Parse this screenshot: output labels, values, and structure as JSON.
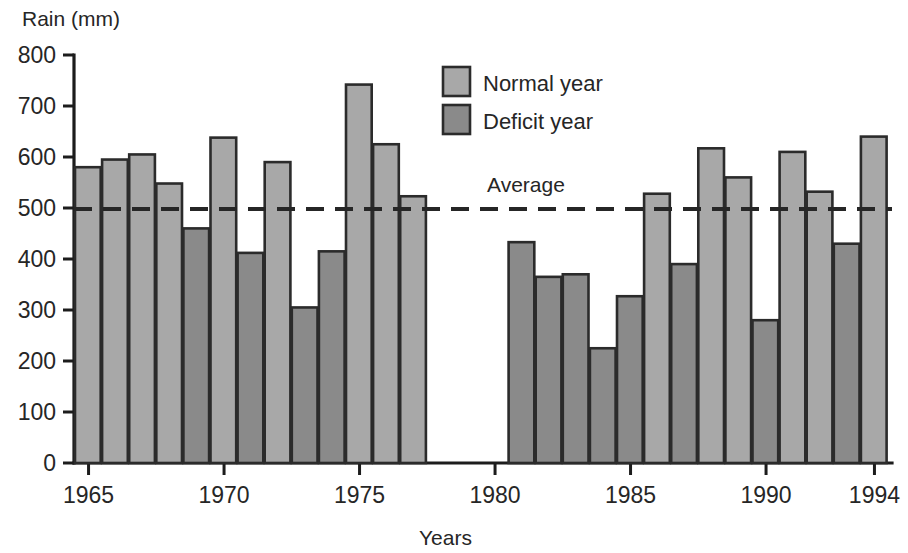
{
  "chart_data": {
    "type": "bar",
    "title": "",
    "xlabel": "Years",
    "ylabel": "Rain (mm)",
    "ylim": [
      0,
      800
    ],
    "xlim": [
      1964.5,
      1994.5
    ],
    "yticks": [
      0,
      100,
      200,
      300,
      400,
      500,
      600,
      700,
      800
    ],
    "ytick_labels": [
      "0",
      "100",
      "200",
      "300",
      "400",
      "500",
      "600",
      "700",
      "800"
    ],
    "xticks": [
      1965,
      1970,
      1975,
      1980,
      1985,
      1990,
      1994
    ],
    "xtick_labels": [
      "1965",
      "1970",
      "1975",
      "1980",
      "1985",
      "1990",
      "1994"
    ],
    "grid": false,
    "legend_position": "top-center",
    "legend": [
      {
        "label": "Normal year",
        "color": "#a8a8a8",
        "key": "normal"
      },
      {
        "label": "Deficit year",
        "color": "#8a8a8a",
        "key": "deficit"
      }
    ],
    "annotations": [
      {
        "label": "Average",
        "value": 500,
        "style": "dashed-horizontal-line"
      }
    ],
    "categories": [
      "1965",
      "1966",
      "1967",
      "1968",
      "1969",
      "1970",
      "1971",
      "1972",
      "1973",
      "1974",
      "1975",
      "1976",
      "1977",
      "1981",
      "1982",
      "1983",
      "1984",
      "1985",
      "1986",
      "1987",
      "1988",
      "1989",
      "1990",
      "1991",
      "1992",
      "1993",
      "1994"
    ],
    "values": [
      580,
      595,
      605,
      548,
      460,
      638,
      412,
      590,
      305,
      415,
      742,
      625,
      523,
      433,
      365,
      370,
      225,
      327,
      528,
      390,
      617,
      560,
      280,
      610,
      532,
      430,
      640
    ],
    "bar_types": [
      "normal",
      "normal",
      "normal",
      "normal",
      "deficit",
      "normal",
      "deficit",
      "normal",
      "deficit",
      "deficit",
      "normal",
      "normal",
      "normal",
      "deficit",
      "deficit",
      "deficit",
      "deficit",
      "deficit",
      "normal",
      "deficit",
      "normal",
      "normal",
      "deficit",
      "normal",
      "normal",
      "deficit",
      "normal"
    ],
    "missing_years": [
      "1978",
      "1979",
      "1980"
    ]
  }
}
